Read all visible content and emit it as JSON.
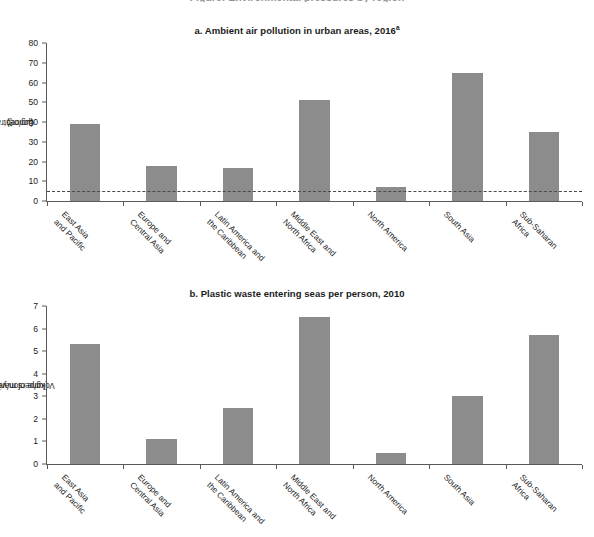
{
  "page": {
    "cut_off_header": "Figure: Environmental pressures by region"
  },
  "panels": [
    {
      "key": "a",
      "title_prefix": "a. Ambient air pollution in urban areas, 2016",
      "title_sup": "a",
      "ylabel": "Concentration of PM2.5 (µg/m³)",
      "ylabel_html_main": "Concentration of PM",
      "ylabel_html_sub": "2.5",
      "ylabel_html_tail": " (µg/m³)",
      "yticks": [
        "0",
        "10",
        "20",
        "30",
        "40",
        "50",
        "60",
        "70",
        "80"
      ],
      "guideline_value": 5
    },
    {
      "key": "b",
      "title_prefix": "b. Plastic waste entering seas per person, 2010",
      "title_sup": "",
      "ylabel": "Volume of marine-plastic waste (kg/person/year)",
      "ylabel_line1": "Volume of marine-plastic waste",
      "ylabel_line2": "(kg/person/year)",
      "yticks": [
        "0",
        "1",
        "2",
        "3",
        "4",
        "5",
        "6",
        "7"
      ]
    }
  ],
  "chart_data": [
    {
      "type": "bar",
      "title": "a. Ambient air pollution in urban areas, 2016a",
      "xlabel": "",
      "ylabel": "Concentration of PM2.5 (µg/m³)",
      "ylim": [
        0,
        80
      ],
      "ytick_step": 10,
      "grid": false,
      "legend": "none",
      "bar_color": "#8c8c8c",
      "categories": [
        "East Asia and Pacific",
        "Europe and Central Asia",
        "Latin America and the Caribbean",
        "Middle East and North Africa",
        "North America",
        "South Asia",
        "Sub-Saharan Africa"
      ],
      "category_lines": [
        [
          "East Asia",
          "and Pacific"
        ],
        [
          "Europe and",
          "Central Asia"
        ],
        [
          "Latin America and",
          "the Caribbean"
        ],
        [
          "Middle East and",
          "North Africa"
        ],
        [
          "North America"
        ],
        [
          "South Asia"
        ],
        [
          "Sub-Saharan",
          "Africa"
        ]
      ],
      "values": [
        39,
        18,
        17,
        51,
        7,
        65,
        35
      ],
      "annotations": [
        {
          "type": "hline",
          "value": 5,
          "style": "dashed",
          "label": ""
        }
      ]
    },
    {
      "type": "bar",
      "title": "b. Plastic waste entering seas per person, 2010",
      "xlabel": "",
      "ylabel": "Volume of marine-plastic waste (kg/person/year)",
      "ylim": [
        0,
        7
      ],
      "ytick_step": 1,
      "grid": false,
      "legend": "none",
      "bar_color": "#8c8c8c",
      "categories": [
        "East Asia and Pacific",
        "Europe and Central Asia",
        "Latin America and the Caribbean",
        "Middle East and North Africa",
        "North America",
        "South Asia",
        "Sub-Saharan Africa"
      ],
      "category_lines": [
        [
          "East Asia",
          "and Pacific"
        ],
        [
          "Europe and",
          "Central Asia"
        ],
        [
          "Latin America and",
          "the Caribbean"
        ],
        [
          "Middle East and",
          "North Africa"
        ],
        [
          "North America"
        ],
        [
          "South Asia"
        ],
        [
          "Sub-Saharan",
          "Africa"
        ]
      ],
      "values": [
        5.3,
        1.1,
        2.5,
        6.5,
        0.5,
        3.0,
        5.7
      ],
      "annotations": []
    }
  ],
  "colors": {
    "bar": "#8c8c8c",
    "axis": "#5a5a5a",
    "text": "#1b1b1b",
    "guideline": "#4a4a4a",
    "background": "#ffffff"
  }
}
